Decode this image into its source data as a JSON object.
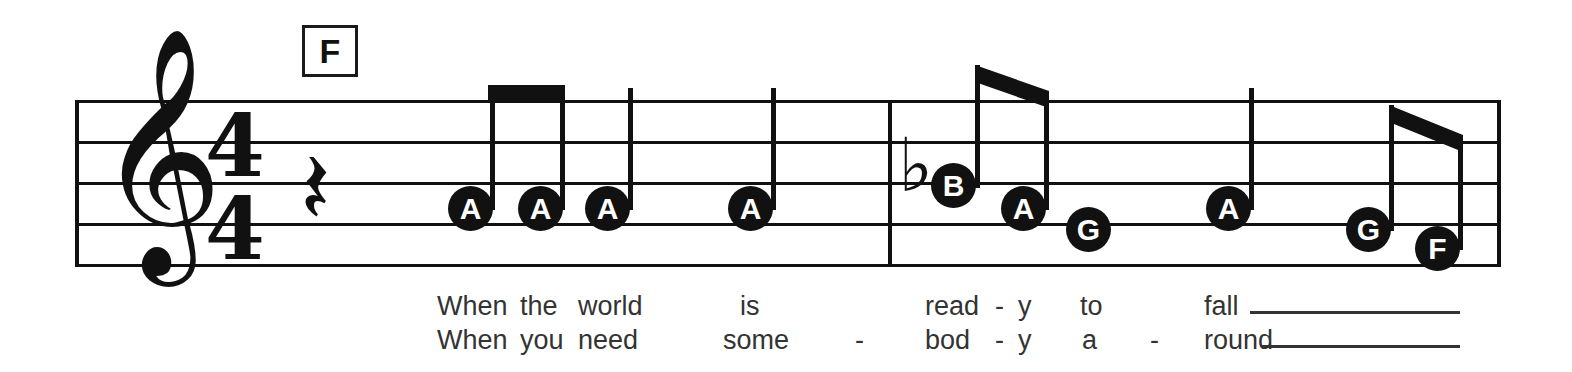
{
  "score": {
    "clef": "treble-clef",
    "clef_glyph": "𝄞",
    "time_signature": {
      "numerator": "4",
      "denominator": "4"
    },
    "rest": {
      "name": "quarter-rest",
      "glyph": "𝄽"
    },
    "chord_symbols": [
      {
        "label": "F",
        "x": 302,
        "y": 25
      }
    ],
    "staff": {
      "left": 75,
      "right": 1500,
      "line_y": [
        100,
        141,
        182,
        223,
        264
      ],
      "barlines_x": [
        888,
        1498
      ]
    },
    "accidentals": [
      {
        "name": "flat",
        "glyph": "♭",
        "x": 900,
        "y": 150
      }
    ],
    "notes": [
      {
        "letter": "A",
        "x": 470,
        "y": 208,
        "stem": "up",
        "duration": "eighth",
        "beam_group": 1
      },
      {
        "letter": "A",
        "x": 540,
        "y": 208,
        "stem": "up",
        "duration": "eighth",
        "beam_group": 1
      },
      {
        "letter": "A",
        "x": 607,
        "y": 208,
        "stem": "up",
        "duration": "quarter",
        "beam_group": 0
      },
      {
        "letter": "A",
        "x": 750,
        "y": 208,
        "stem": "up",
        "duration": "quarter",
        "beam_group": 0
      },
      {
        "letter": "B",
        "x": 954,
        "y": 185,
        "stem": "up",
        "duration": "eighth",
        "beam_group": 2
      },
      {
        "letter": "A",
        "x": 1023,
        "y": 208,
        "stem": "up",
        "duration": "eighth",
        "beam_group": 2
      },
      {
        "letter": "G",
        "x": 1088,
        "y": 229,
        "stem": "none",
        "duration": "quarter",
        "beam_group": 0
      },
      {
        "letter": "A",
        "x": 1228,
        "y": 208,
        "stem": "up",
        "duration": "quarter",
        "beam_group": 0
      },
      {
        "letter": "G",
        "x": 1368,
        "y": 229,
        "stem": "up",
        "duration": "eighth",
        "beam_group": 3
      },
      {
        "letter": "F",
        "x": 1437,
        "y": 248,
        "stem": "up",
        "duration": "eighth",
        "beam_group": 3
      }
    ],
    "lyrics": {
      "line1": [
        {
          "text": "When",
          "x": 437
        },
        {
          "text": "the",
          "x": 520
        },
        {
          "text": "world",
          "x": 578
        },
        {
          "text": "is",
          "x": 740
        },
        {
          "text": "read",
          "x": 925
        },
        {
          "text": "-",
          "x": 995
        },
        {
          "text": "y",
          "x": 1018
        },
        {
          "text": "to",
          "x": 1080
        },
        {
          "text": "fall",
          "x": 1204
        }
      ],
      "line2": [
        {
          "text": "When",
          "x": 437
        },
        {
          "text": "you",
          "x": 520
        },
        {
          "text": "need",
          "x": 578
        },
        {
          "text": "some",
          "x": 723
        },
        {
          "text": "-",
          "x": 855
        },
        {
          "text": "bod",
          "x": 925
        },
        {
          "text": "-",
          "x": 995
        },
        {
          "text": "y",
          "x": 1018
        },
        {
          "text": "a",
          "x": 1082
        },
        {
          "text": "-",
          "x": 1150
        },
        {
          "text": "round",
          "x": 1204
        }
      ],
      "melismas": [
        {
          "line": 1,
          "x": 1250,
          "width": 210,
          "y": 311
        },
        {
          "line": 2,
          "x": 1262,
          "width": 198,
          "y": 345
        }
      ],
      "line1_y": 291,
      "line2_y": 325
    },
    "colors": {
      "ink": "#111111",
      "lyric_ink": "#333333",
      "paper": "#ffffff"
    }
  }
}
